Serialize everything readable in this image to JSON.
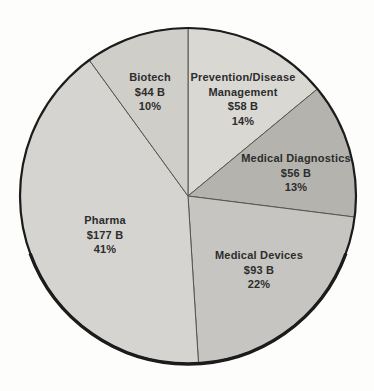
{
  "chart_data": {
    "type": "pie",
    "title": "",
    "start_angle_deg": -90,
    "direction": "clockwise",
    "background_color": "#fdfdfb",
    "divider_color": "#555550",
    "rim_color": "#1c1c1c",
    "total_percent": 100,
    "slices": [
      {
        "id": "prevention-disease-management",
        "label": "Prevention/Disease Management",
        "value_billions": 58,
        "value_label": "$58 B",
        "percent": 14,
        "percent_label": "14%",
        "color": "#d9d8d3",
        "label_lines": [
          "Prevention/Disease",
          "Management",
          "$58 B",
          "14%"
        ],
        "label_x": 243,
        "label_y": 81
      },
      {
        "id": "medical-diagnostics",
        "label": "Medical Diagnostics",
        "value_billions": 56,
        "value_label": "$56 B",
        "percent": 13,
        "percent_label": "13%",
        "color": "#b4b3ae",
        "label_lines": [
          "Medical Diagnostics",
          "$56 B",
          "13%"
        ],
        "label_x": 296,
        "label_y": 162
      },
      {
        "id": "medical-devices",
        "label": "Medical Devices",
        "value_billions": 93,
        "value_label": "$93 B",
        "percent": 22,
        "percent_label": "22%",
        "color": "#c6c5c1",
        "label_lines": [
          "Medical Devices",
          "$93 B",
          "22%"
        ],
        "label_x": 259,
        "label_y": 259
      },
      {
        "id": "pharma",
        "label": "Pharma",
        "value_billions": 177,
        "value_label": "$177 B",
        "percent": 41,
        "percent_label": "41%",
        "color": "#d5d4d0",
        "label_lines": [
          "Pharma",
          "$177 B",
          "41%"
        ],
        "label_x": 105,
        "label_y": 224
      },
      {
        "id": "biotech",
        "label": "Biotech",
        "value_billions": 44,
        "value_label": "$44 B",
        "percent": 10,
        "percent_label": "10%",
        "color": "#cfcec8",
        "label_lines": [
          "Biotech",
          "$44 B",
          "10%"
        ],
        "label_x": 150,
        "label_y": 81
      }
    ]
  }
}
